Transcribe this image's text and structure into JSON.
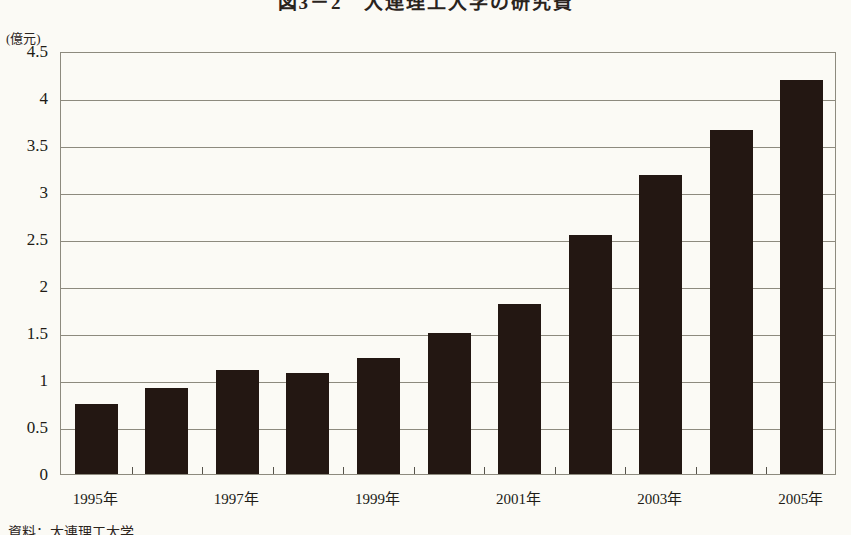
{
  "figure": {
    "title": "図3－2　大連理工大学の研究費",
    "source_note": "資料：大連理工大学",
    "y_unit_label": "(億元)"
  },
  "colors": {
    "bar": "#231712",
    "grid": "#8d8a7e",
    "background": "#fbfaf5",
    "text": "#201b15"
  },
  "chart_data": {
    "type": "bar",
    "title": "図3－2　大連理工大学の研究費",
    "xlabel": "",
    "ylabel": "(億元)",
    "ylim": [
      0,
      4.5
    ],
    "ytick_values": [
      0,
      0.5,
      1,
      1.5,
      2,
      2.5,
      3,
      3.5,
      4,
      4.5
    ],
    "ytick_labels": [
      "0",
      "0.5",
      "1",
      "1.5",
      "2",
      "2.5",
      "3",
      "3.5",
      "4",
      "4.5"
    ],
    "grid": true,
    "legend": false,
    "categories": [
      "1995年",
      "1996年",
      "1997年",
      "1998年",
      "1999年",
      "2000年",
      "2001年",
      "2002年",
      "2003年",
      "2004年",
      "2005年"
    ],
    "values": [
      0.74,
      0.92,
      1.11,
      1.07,
      1.23,
      1.5,
      1.81,
      2.54,
      3.18,
      3.66,
      4.19
    ],
    "xtick_labels": [
      "1995年",
      "1997年",
      "1999年",
      "2001年",
      "2003年",
      "2005年"
    ],
    "xtick_categories": [
      "1995年",
      "1997年",
      "1999年",
      "2001年",
      "2003年",
      "2005年"
    ]
  }
}
